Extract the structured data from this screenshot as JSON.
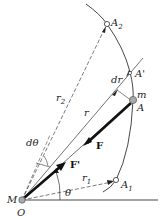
{
  "diagram": {
    "type": "central-force-orbit",
    "points": {
      "origin": {
        "label_top": "M",
        "label_bottom": "O"
      },
      "A": {
        "label": "A",
        "mass_label": "m"
      },
      "A_prime": {
        "label": "A'"
      },
      "A1": {
        "label": "A",
        "subscript": "1"
      },
      "A2": {
        "label": "A",
        "subscript": "2"
      }
    },
    "vectors": {
      "F": {
        "label": "F"
      },
      "F_prime": {
        "label": "F'"
      }
    },
    "distances": {
      "r": {
        "label": "r"
      },
      "r1": {
        "label": "r",
        "subscript": "1"
      },
      "r2": {
        "label": "r",
        "subscript": "2"
      },
      "dr": {
        "label": "dr"
      }
    },
    "angles": {
      "theta": {
        "label": "θ"
      },
      "dtheta": {
        "label": "dθ"
      }
    },
    "colors": {
      "line": "#333333",
      "point_fill": "#aaaaaa",
      "background": "#ffffff"
    }
  }
}
